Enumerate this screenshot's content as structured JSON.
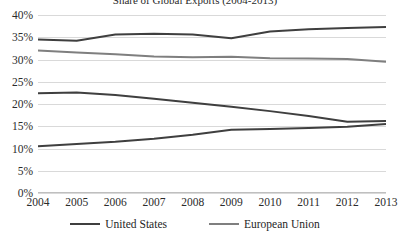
{
  "chart_data": {
    "type": "line",
    "title": "Share of Global Exports (2004-2013)",
    "xlabel": "",
    "ylabel": "",
    "x": [
      2004,
      2005,
      2006,
      2007,
      2008,
      2009,
      2010,
      2011,
      2012,
      2013
    ],
    "categories": [
      "2004",
      "2005",
      "2006",
      "2007",
      "2008",
      "2009",
      "2010",
      "2011",
      "2012",
      "2013"
    ],
    "ylim": [
      0,
      40
    ],
    "yticks": [
      0,
      5,
      10,
      15,
      20,
      25,
      30,
      35,
      40
    ],
    "ytick_labels": [
      "0%",
      "5%",
      "10%",
      "15%",
      "20%",
      "25%",
      "30%",
      "35%",
      "40%"
    ],
    "grid": true,
    "legend_position": "bottom",
    "series": [
      {
        "name": "United States",
        "color": "#3f3f3f",
        "values": [
          34.5,
          34.2,
          35.6,
          35.8,
          35.6,
          34.8,
          36.3,
          36.8,
          37.1,
          37.3
        ]
      },
      {
        "name": "European Union",
        "color": "#7f7f7f",
        "values": [
          32.0,
          31.6,
          31.2,
          30.7,
          30.5,
          30.6,
          30.3,
          30.2,
          30.1,
          29.5
        ]
      },
      {
        "name": "series-3",
        "color": "#3f3f3f",
        "values": [
          22.4,
          22.6,
          22.0,
          21.2,
          20.3,
          19.4,
          18.4,
          17.3,
          16.0,
          16.2
        ]
      },
      {
        "name": "series-4",
        "color": "#3f3f3f",
        "values": [
          10.5,
          11.0,
          11.5,
          12.2,
          13.1,
          14.2,
          14.4,
          14.6,
          14.9,
          15.5
        ]
      }
    ],
    "legend": [
      {
        "label": "United States",
        "color": "#3f3f3f"
      },
      {
        "label": "European Union",
        "color": "#7f7f7f"
      }
    ]
  }
}
